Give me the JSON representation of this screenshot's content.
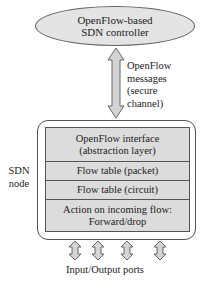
{
  "controller": {
    "line1": "OpenFlow-based",
    "line2": "SDN controller"
  },
  "channel": {
    "lines": [
      "OpenFlow",
      "messages",
      "(secure",
      "channel)"
    ]
  },
  "node": {
    "label_line1": "SDN",
    "label_line2": "node",
    "layers": [
      {
        "line1": "OpenFlow interface",
        "line2": "(abstraction layer)"
      },
      {
        "line1": "Flow table (packet)"
      },
      {
        "line1": "Flow table (circuit)"
      },
      {
        "line1": "Action on incoming flow:",
        "line2": "Forward/drop"
      }
    ]
  },
  "ports": {
    "label": "Input/Output ports",
    "count": 4
  },
  "colors": {
    "fill": "#dcdcdc",
    "ellipse_fill": "#e4e4e4",
    "stroke": "#555555"
  }
}
